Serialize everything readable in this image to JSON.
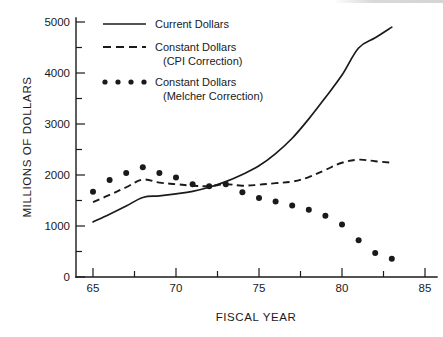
{
  "chart_data": {
    "type": "line",
    "title": "",
    "xlabel": "FISCAL YEAR",
    "ylabel": "MILLIONS OF DOLLARS",
    "xlim": [
      64,
      86
    ],
    "ylim": [
      0,
      5000
    ],
    "grid": false,
    "legend_position": "top-left",
    "x_ticks_major": [
      "65",
      "70",
      "75",
      "80",
      "85"
    ],
    "x_ticks_major_values": [
      65,
      70,
      75,
      80,
      85
    ],
    "x_ticks_minor_values": [
      67.5,
      72.5,
      77.5,
      82.5
    ],
    "y_ticks_major": [
      "0",
      "1000",
      "2000",
      "3000",
      "4000",
      "5000"
    ],
    "y_ticks_major_values": [
      0,
      1000,
      2000,
      3000,
      4000,
      5000
    ],
    "y_ticks_minor_values": [
      500,
      1500,
      2500,
      3500,
      4500
    ],
    "series": [
      {
        "name": "Current Dollars",
        "style": "solid",
        "x": [
          65,
          66,
          67,
          68,
          69,
          70,
          71,
          72,
          73,
          74,
          75,
          76,
          77,
          78,
          79,
          80,
          81,
          82,
          83
        ],
        "values": [
          1080,
          1230,
          1390,
          1560,
          1590,
          1630,
          1680,
          1760,
          1870,
          2010,
          2180,
          2420,
          2720,
          3100,
          3520,
          3960,
          4490,
          4690,
          4900
        ]
      },
      {
        "name": "Constant Dollars (CPI Correction)",
        "style": "dashed",
        "x": [
          65,
          66,
          67,
          68,
          69,
          70,
          71,
          72,
          73,
          74,
          75,
          76,
          77,
          78,
          79,
          80,
          81,
          82,
          83
        ],
        "values": [
          1470,
          1610,
          1760,
          1910,
          1850,
          1820,
          1790,
          1780,
          1820,
          1790,
          1810,
          1840,
          1870,
          1960,
          2100,
          2240,
          2300,
          2270,
          2240
        ]
      },
      {
        "name": "Constant Dollars (Melcher Correction)",
        "style": "dots",
        "x": [
          65,
          66,
          67,
          68,
          69,
          70,
          71,
          72,
          73,
          74,
          75,
          76,
          77,
          78,
          79,
          80,
          81,
          82,
          83
        ],
        "values": [
          1670,
          1900,
          2040,
          2150,
          2040,
          1950,
          1820,
          1780,
          1820,
          1660,
          1550,
          1480,
          1400,
          1320,
          1200,
          1030,
          720,
          470,
          360
        ]
      }
    ],
    "legend_entries": [
      {
        "label_line1": "Current Dollars",
        "label_line2": "",
        "style": "solid"
      },
      {
        "label_line1": "Constant Dollars",
        "label_line2": "(CPI Correction)",
        "style": "dashed"
      },
      {
        "label_line1": "Constant Dollars",
        "label_line2": "(Melcher Correction)",
        "style": "dots"
      }
    ],
    "colors": {
      "ink": "#1a1a1a",
      "background": "#ffffff"
    }
  },
  "axes": {
    "y_title": "MILLIONS OF DOLLARS",
    "x_title": "FISCAL YEAR",
    "y_labels": [
      "5000",
      "4000",
      "3000",
      "2000",
      "1000",
      "0"
    ],
    "x_labels": [
      "65",
      "70",
      "75",
      "80",
      "85"
    ]
  },
  "legend": {
    "item0_line1": "Current Dollars",
    "item1_line1": "Constant Dollars",
    "item1_line2": "(CPI Correction)",
    "item2_line1": "Constant Dollars",
    "item2_line2": "(Melcher Correction)"
  }
}
